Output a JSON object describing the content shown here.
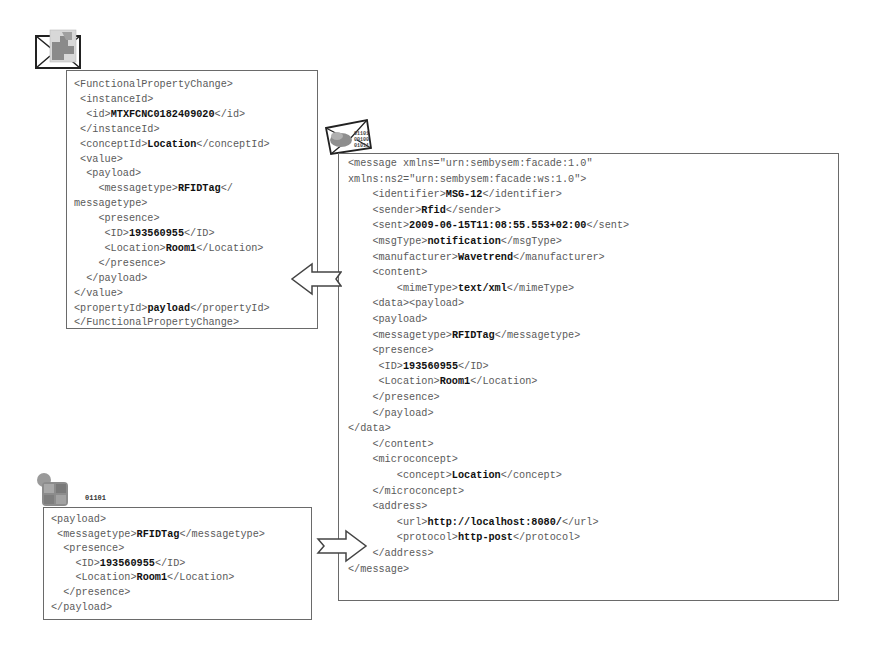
{
  "functional_property_change_box": {
    "lines": [
      {
        "indent": 0,
        "pre": "<FunctionalPropertyChange>",
        "val": "",
        "post": ""
      },
      {
        "indent": 1,
        "pre": "<instanceId>",
        "val": "",
        "post": ""
      },
      {
        "indent": 2,
        "pre": "<id>",
        "val": "MTXFCNC0182409020",
        "post": "</id>"
      },
      {
        "indent": 1,
        "pre": "</instanceId>",
        "val": "",
        "post": ""
      },
      {
        "indent": 1,
        "pre": "<conceptId>",
        "val": "Location",
        "post": "</conceptId>"
      },
      {
        "indent": 1,
        "pre": "<value>",
        "val": "",
        "post": ""
      },
      {
        "indent": 2,
        "pre": "<payload>",
        "val": "",
        "post": ""
      },
      {
        "indent": 4,
        "pre": "<messagetype>",
        "val": "RFIDTag",
        "post": "</"
      },
      {
        "indent": 0,
        "pre": "messagetype>",
        "val": "",
        "post": ""
      },
      {
        "indent": 4,
        "pre": "<presence>",
        "val": "",
        "post": ""
      },
      {
        "indent": 5,
        "pre": "<ID>",
        "val": "193560955",
        "post": "</ID>"
      },
      {
        "indent": 5,
        "pre": "<Location>",
        "val": "Room1",
        "post": "</Location>"
      },
      {
        "indent": 4,
        "pre": "</presence>",
        "val": "",
        "post": ""
      },
      {
        "indent": 2,
        "pre": "</payload>",
        "val": "",
        "post": ""
      },
      {
        "indent": 0,
        "pre": "</value>",
        "val": "",
        "post": ""
      },
      {
        "indent": 0,
        "pre": "<propertyId>",
        "val": "payload",
        "post": "</propertyId>"
      },
      {
        "indent": 0,
        "pre": "</FunctionalPropertyChange>",
        "val": "",
        "post": ""
      }
    ]
  },
  "message_box": {
    "lines": [
      {
        "indent": 0,
        "pre": "<message xmlns=\"urn:sembysem:facade:1.0\"",
        "val": "",
        "post": ""
      },
      {
        "indent": 0,
        "pre": "xmlns:ns2=\"urn:sembysem:facade:ws:1.0\">",
        "val": "",
        "post": ""
      },
      {
        "indent": 4,
        "pre": "<identifier>",
        "val": "MSG-12",
        "post": "</identifier>"
      },
      {
        "indent": 4,
        "pre": "<sender>",
        "val": "Rfid",
        "post": "</sender>"
      },
      {
        "indent": 4,
        "pre": "<sent>",
        "val": "2009-06-15T11:08:55.553+02:00",
        "post": "</sent>"
      },
      {
        "indent": 4,
        "pre": "<msgType>",
        "val": "notification",
        "post": "</msgType>"
      },
      {
        "indent": 4,
        "pre": "<manufacturer>",
        "val": "Wavetrend",
        "post": "</manufacturer>"
      },
      {
        "indent": 4,
        "pre": "<content>",
        "val": "",
        "post": ""
      },
      {
        "indent": 8,
        "pre": "<mimeType>",
        "val": "text/xml",
        "post": "</mimeType>"
      },
      {
        "indent": 4,
        "pre": "<data><payload>",
        "val": "",
        "post": ""
      },
      {
        "indent": 4,
        "pre": "<payload>",
        "val": "",
        "post": ""
      },
      {
        "indent": 4,
        "pre": "<messagetype>",
        "val": "RFIDTag",
        "post": "</messagetype>"
      },
      {
        "indent": 4,
        "pre": "<presence>",
        "val": "",
        "post": ""
      },
      {
        "indent": 5,
        "pre": "<ID>",
        "val": "193560955",
        "post": "</ID>"
      },
      {
        "indent": 5,
        "pre": "<Location>",
        "val": "Room1",
        "post": "</Location>"
      },
      {
        "indent": 4,
        "pre": "</presence>",
        "val": "",
        "post": ""
      },
      {
        "indent": 4,
        "pre": "</payload>",
        "val": "",
        "post": ""
      },
      {
        "indent": 0,
        "pre": "</data>",
        "val": "",
        "post": ""
      },
      {
        "indent": 4,
        "pre": "</content>",
        "val": "",
        "post": ""
      },
      {
        "indent": 4,
        "pre": "<microconcept>",
        "val": "",
        "post": ""
      },
      {
        "indent": 8,
        "pre": "<concept>",
        "val": "Location",
        "post": "</concept>"
      },
      {
        "indent": 4,
        "pre": "</microconcept>",
        "val": "",
        "post": ""
      },
      {
        "indent": 4,
        "pre": "<address>",
        "val": "",
        "post": ""
      },
      {
        "indent": 8,
        "pre": "<url>",
        "val": "http://localhost:8080/",
        "post": "</url>"
      },
      {
        "indent": 8,
        "pre": "<protocol>",
        "val": "http-post",
        "post": "</protocol>"
      },
      {
        "indent": 4,
        "pre": "</address>",
        "val": "",
        "post": ""
      },
      {
        "indent": 0,
        "pre": "</message>",
        "val": "",
        "post": ""
      }
    ]
  },
  "payload_box": {
    "lines": [
      {
        "indent": 0,
        "pre": "<payload>",
        "val": "",
        "post": ""
      },
      {
        "indent": 1,
        "pre": "<messagetype>",
        "val": "RFIDTag",
        "post": "</messagetype>"
      },
      {
        "indent": 2,
        "pre": "<presence>",
        "val": "",
        "post": ""
      },
      {
        "indent": 4,
        "pre": "<ID>",
        "val": "193560955",
        "post": "</ID>"
      },
      {
        "indent": 4,
        "pre": "<Location>",
        "val": "Room1",
        "post": "</Location>"
      },
      {
        "indent": 2,
        "pre": "</presence>",
        "val": "",
        "post": ""
      },
      {
        "indent": 0,
        "pre": "</payload>",
        "val": "",
        "post": ""
      }
    ]
  },
  "icons": {
    "binary_digits": [
      "01101",
      "00100",
      "01011"
    ]
  }
}
